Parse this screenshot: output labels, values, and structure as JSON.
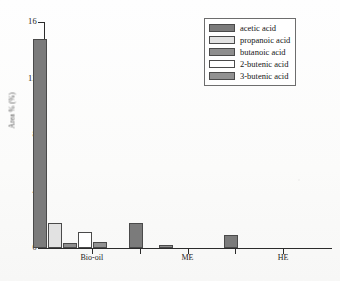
{
  "chart_data": {
    "type": "bar",
    "title": "",
    "xlabel": "",
    "ylabel": "Area % (%)",
    "categories": [
      "Bio-oil",
      "ME",
      "HE"
    ],
    "ylim": [
      0,
      16
    ],
    "yticks": [
      0,
      4,
      8,
      12,
      16
    ],
    "ytick_labels": [
      "0",
      "4",
      "8",
      "12",
      "16"
    ],
    "grid": false,
    "legend_position": "top-right",
    "series": [
      {
        "name": "acetic acid",
        "color": "#7b7b7b",
        "values": [
          14.8,
          1.8,
          0.9
        ]
      },
      {
        "name": "propanoic acid",
        "color": "#e2e2e2",
        "values": [
          1.8,
          0.0,
          0.0
        ]
      },
      {
        "name": "butanoic acid",
        "color": "#8e8e8e",
        "values": [
          0.35,
          0.2,
          0.0
        ]
      },
      {
        "name": "2-butenic acid",
        "color": "#ffffff",
        "values": [
          1.15,
          0.0,
          0.0
        ]
      },
      {
        "name": "3-butenic acid",
        "color": "#919191",
        "values": [
          0.45,
          0.0,
          0.0
        ]
      }
    ]
  },
  "legend": {
    "items": [
      {
        "label": "acetic acid",
        "color": "#7b7b7b"
      },
      {
        "label": "propanoic acid",
        "color": "#e2e2e2"
      },
      {
        "label": "butanoic acid",
        "color": "#8e8e8e"
      },
      {
        "label": "2-butenic acid",
        "color": "#ffffff"
      },
      {
        "label": "3-butenic acid",
        "color": "#919191"
      }
    ]
  },
  "colors": {
    "axis": "#2b2b2b",
    "text": "#151515",
    "background": "#fdfdfc"
  }
}
